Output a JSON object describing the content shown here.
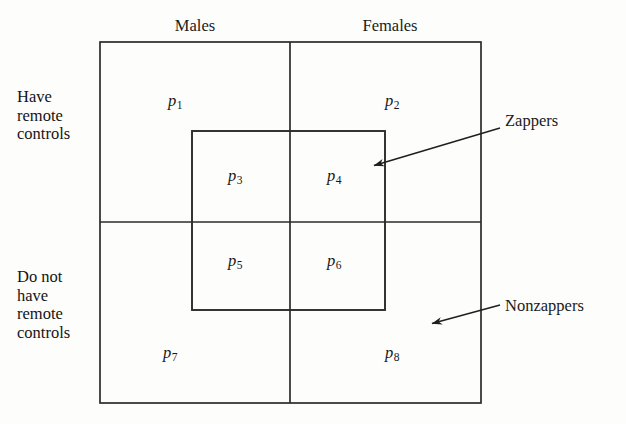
{
  "figure": {
    "type": "venn-style-partition-diagram",
    "title": "",
    "column_headers": [
      {
        "label": "Males",
        "x": 195,
        "y": 16
      },
      {
        "label": "Females",
        "x": 390,
        "y": 16
      }
    ],
    "row_labels": [
      {
        "lines": [
          "Have",
          "remote",
          "controls"
        ],
        "x": 17,
        "y": 88
      },
      {
        "lines": [
          "Do not",
          "have",
          "remote",
          "controls"
        ],
        "x": 17,
        "y": 268
      }
    ],
    "callouts": [
      {
        "label": "Zappers",
        "text_x": 505,
        "text_y": 111,
        "arrow": {
          "x1": 500,
          "y1": 128,
          "x2": 373,
          "y2": 166
        }
      },
      {
        "label": "Nonzappers",
        "text_x": 505,
        "text_y": 296,
        "arrow": {
          "x1": 500,
          "y1": 305,
          "x2": 430,
          "y2": 324
        }
      }
    ],
    "outer_box": {
      "x": 100,
      "y": 42,
      "width": 381,
      "height": 361
    },
    "inner_box": {
      "x": 192,
      "y": 131,
      "width": 193,
      "height": 179
    },
    "divider_vertical_x": 290,
    "divider_horizontal_y": 222,
    "line_color": "#2b2b2b",
    "background_color": "#fdfdfc",
    "cells": [
      {
        "name": "p1",
        "base": "p",
        "sub": "1",
        "x": 168,
        "y": 92,
        "region": "males-have-remote-nonzapper"
      },
      {
        "name": "p2",
        "base": "p",
        "sub": "2",
        "x": 385,
        "y": 92,
        "region": "females-have-remote-nonzapper"
      },
      {
        "name": "p3",
        "base": "p",
        "sub": "3",
        "x": 228,
        "y": 167,
        "region": "males-have-remote-zapper"
      },
      {
        "name": "p4",
        "base": "p",
        "sub": "4",
        "x": 327,
        "y": 167,
        "region": "females-have-remote-zapper"
      },
      {
        "name": "p5",
        "base": "p",
        "sub": "5",
        "x": 228,
        "y": 252,
        "region": "males-no-remote-zapper"
      },
      {
        "name": "p6",
        "base": "p",
        "sub": "6",
        "x": 327,
        "y": 252,
        "region": "females-no-remote-zapper"
      },
      {
        "name": "p7",
        "base": "p",
        "sub": "7",
        "x": 163,
        "y": 344,
        "region": "males-no-remote-nonzapper"
      },
      {
        "name": "p8",
        "base": "p",
        "sub": "8",
        "x": 385,
        "y": 344,
        "region": "females-no-remote-nonzapper"
      }
    ]
  }
}
